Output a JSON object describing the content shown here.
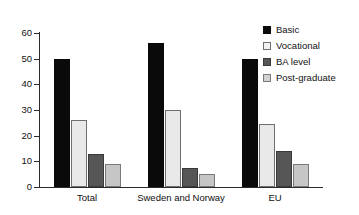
{
  "chart_data": {
    "type": "bar",
    "title": "",
    "subtitle": "",
    "xlabel": "",
    "ylabel": "",
    "ylim": [
      0,
      60
    ],
    "yticks": [
      0,
      10,
      20,
      30,
      40,
      50,
      60
    ],
    "ytick_labels": [
      "0",
      "10",
      "20",
      "30",
      "40",
      "50",
      "60"
    ],
    "grid": false,
    "legend_position": "right",
    "categories": [
      "Total",
      "Sweden and Norway",
      "EU"
    ],
    "series": [
      {
        "name": "Basic",
        "color": "#0a0a0a",
        "values": [
          50,
          56,
          50
        ]
      },
      {
        "name": "Vocational",
        "color": "#e9e9e9",
        "values": [
          26,
          30,
          24.5
        ]
      },
      {
        "name": "BA level",
        "color": "#565656",
        "values": [
          13,
          7.5,
          14
        ]
      },
      {
        "name": "Post-graduate",
        "color": "#c6c6c6",
        "values": [
          9,
          5,
          9
        ]
      }
    ]
  },
  "legend": {
    "items": [
      {
        "label": "Basic"
      },
      {
        "label": "Vocational"
      },
      {
        "label": "BA level"
      },
      {
        "label": "Post-graduate"
      }
    ]
  },
  "axis": {
    "y_labels": [
      "0",
      "10",
      "20",
      "30",
      "40",
      "50",
      "60"
    ],
    "x_labels": [
      "Total",
      "Sweden and Norway",
      "EU"
    ]
  }
}
